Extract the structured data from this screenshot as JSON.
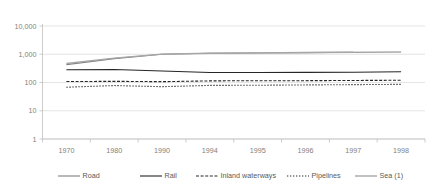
{
  "chart_data": {
    "type": "line",
    "title": "",
    "subtitle": "",
    "xlabel": "",
    "ylabel": "",
    "yscale": "log",
    "ylim": [
      1,
      10000
    ],
    "grid": true,
    "legend_position": "bottom",
    "categories": [
      "1970",
      "1980",
      "1990",
      "1994",
      "1995",
      "1996",
      "1997",
      "1998"
    ],
    "ytick_labels": [
      "10,000",
      "1,000",
      "100",
      "10",
      "1"
    ],
    "ytick_values": [
      10000,
      1000,
      100,
      10,
      1
    ],
    "series": [
      {
        "name": "Road",
        "style": "solid",
        "color": "#808080",
        "width": 1.1,
        "values": [
          430,
          700,
          1000,
          1080,
          1110,
          1140,
          1170,
          1200
        ]
      },
      {
        "name": "Rail",
        "style": "solid",
        "color": "#262626",
        "width": 1.1,
        "values": [
          282,
          290,
          255,
          225,
          226,
          228,
          230,
          240
        ]
      },
      {
        "name": "Inland waterways",
        "style": "dashed",
        "color": "#262626",
        "width": 1.1,
        "values": [
          108,
          110,
          107,
          114,
          116,
          116,
          118,
          120
        ]
      },
      {
        "name": "Pipelines",
        "style": "dotted",
        "color": "#262626",
        "width": 1.1,
        "values": [
          68,
          78,
          71,
          79,
          80,
          82,
          84,
          86
        ]
      },
      {
        "name": "Sea (1)",
        "style": "solid",
        "color": "#a6a6a6",
        "width": 1.4,
        "values": [
          470,
          730,
          1010,
          1090,
          1120,
          1150,
          1180,
          null
        ]
      }
    ]
  },
  "legend": {
    "items": [
      {
        "label": "Road",
        "style": "solid",
        "color": "#808080"
      },
      {
        "label": "Rail",
        "style": "solid",
        "color": "#262626"
      },
      {
        "label": "Inland waterways",
        "style": "dashed",
        "color": "#262626"
      },
      {
        "label": "Pipelines",
        "style": "dotted",
        "color": "#262626"
      },
      {
        "label": "Sea (1)",
        "style": "solid",
        "color": "#a6a6a6"
      }
    ]
  },
  "colors": {
    "background": "#ffffff",
    "gridline": "#d9d9d9",
    "axis": "#bfbfbf",
    "tick_text": "#7f7f7f",
    "legend_text": "#595959"
  }
}
